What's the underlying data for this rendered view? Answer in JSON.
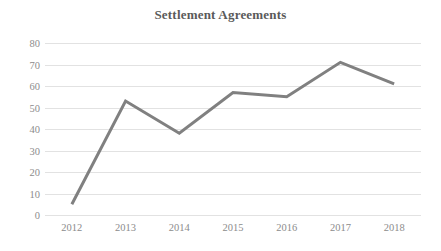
{
  "chart_data": {
    "type": "line",
    "title": "Settlement Agreements",
    "xlabel": "",
    "ylabel": "",
    "categories": [
      "2012",
      "2013",
      "2014",
      "2015",
      "2016",
      "2017",
      "2018"
    ],
    "values": [
      5,
      53,
      38,
      57,
      55,
      71,
      61
    ],
    "series": [
      {
        "name": "Settlement Agreements",
        "values": [
          5,
          53,
          38,
          57,
          55,
          71,
          61
        ]
      }
    ],
    "ylim": [
      0,
      80
    ],
    "y_ticks": [
      "80",
      "70",
      "60",
      "50",
      "40",
      "30",
      "20",
      "10",
      "0"
    ],
    "y_tick_values": [
      80,
      70,
      60,
      50,
      40,
      30,
      20,
      10,
      0
    ],
    "grid": true,
    "legend": false,
    "legend_position": "none",
    "colors": {
      "line": "#808080",
      "gridline": "#e2e2e2",
      "tick_label": "#8c8c8c",
      "title": "#5a5a5a",
      "background": "#ffffff"
    },
    "line_width": 3
  }
}
